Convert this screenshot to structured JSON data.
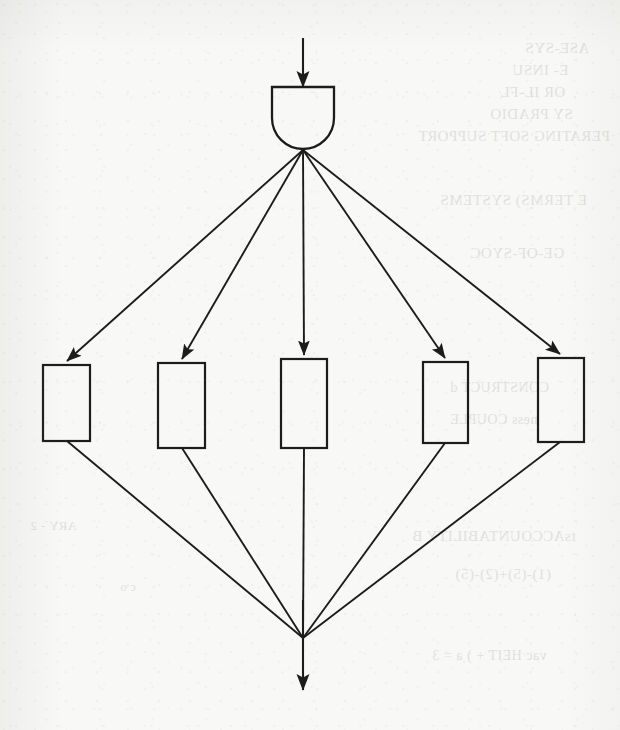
{
  "page": {
    "background_color": "#f8f8f6",
    "ink_color": "#1c1c1c",
    "width": 620,
    "height": 730
  },
  "diagram": {
    "type": "reliability-block-diagram",
    "input_arrow": {
      "label": "",
      "from": [
        303,
        38
      ],
      "to": [
        303,
        86
      ]
    },
    "gate": {
      "name": "and-gate",
      "label": "",
      "x": 272,
      "y": 86,
      "width": 62,
      "height": 62,
      "shape": "flat-top-round-bottom"
    },
    "fanout_point": [
      303,
      150
    ],
    "fanin_point": [
      303,
      638
    ],
    "blocks": [
      {
        "label": "",
        "x": 43,
        "y": 365,
        "width": 47,
        "height": 76
      },
      {
        "label": "",
        "x": 158,
        "y": 363,
        "width": 47,
        "height": 85
      },
      {
        "label": "",
        "x": 281,
        "y": 359,
        "width": 46,
        "height": 89
      },
      {
        "label": "",
        "x": 423,
        "y": 362,
        "width": 45,
        "height": 81
      },
      {
        "label": "",
        "x": 538,
        "y": 358,
        "width": 46,
        "height": 84
      }
    ],
    "output_arrow": {
      "label": "",
      "from": [
        303,
        638
      ],
      "to": [
        303,
        690
      ]
    },
    "block_count": 5
  },
  "showthrough": [
    {
      "text": "ASE-SYS",
      "x": 525,
      "y": 40,
      "size": 15
    },
    {
      "text": "E- INSU",
      "x": 512,
      "y": 62,
      "size": 15
    },
    {
      "text": "OR  IL-FL",
      "x": 500,
      "y": 84,
      "size": 15
    },
    {
      "text": "SY  PRADIO",
      "x": 490,
      "y": 106,
      "size": 15
    },
    {
      "text": "PERATING SOFT SUPPORT",
      "x": 418,
      "y": 128,
      "size": 15
    },
    {
      "text": "E  TERMS) SYSTEMS",
      "x": 440,
      "y": 192,
      "size": 15
    },
    {
      "text": "GE-OF-SYOC",
      "x": 470,
      "y": 245,
      "size": 15
    },
    {
      "text": "CONSTRUCT  d",
      "x": 450,
      "y": 380,
      "size": 14
    },
    {
      "text": "ness  COUPLE",
      "x": 450,
      "y": 412,
      "size": 14
    },
    {
      "text": "tsACCOUNTABILITY  B",
      "x": 412,
      "y": 528,
      "size": 15
    },
    {
      "text": "(1)-(5)+(2)-(5)",
      "x": 455,
      "y": 566,
      "size": 15
    },
    {
      "text": "vac  HEIT + ) a = 3",
      "x": 432,
      "y": 648,
      "size": 14
    },
    {
      "text": "ARY - 2",
      "x": 30,
      "y": 518,
      "size": 13
    },
    {
      "text": "c  o",
      "x": 120,
      "y": 580,
      "size": 12
    }
  ]
}
